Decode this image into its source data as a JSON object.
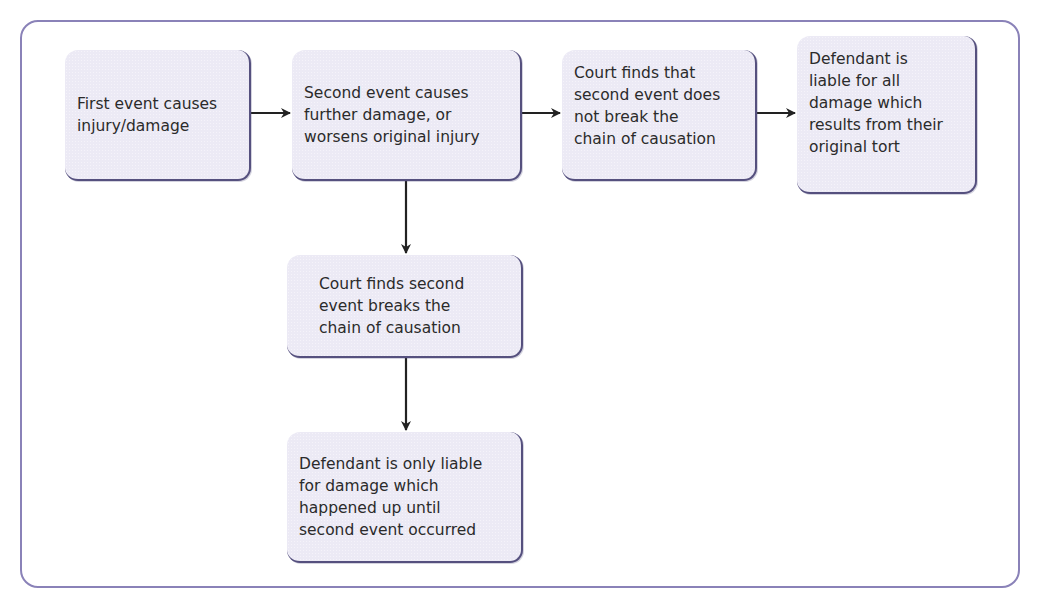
{
  "diagram": {
    "type": "flowchart",
    "nodes": [
      {
        "id": "first_event",
        "text": "First event causes\ninjury/damage"
      },
      {
        "id": "second_event",
        "text": "Second event causes\nfurther damage, or\nworsens original injury"
      },
      {
        "id": "court_not_break",
        "text": "Court finds that\nsecond event does\nnot break the\nchain of causation"
      },
      {
        "id": "liable_all",
        "text": "Defendant is\nliable for all\ndamage which\nresults from their\noriginal tort"
      },
      {
        "id": "court_breaks",
        "text": "Court finds second\nevent breaks the\nchain of causation"
      },
      {
        "id": "liable_only",
        "text": "Defendant is only liable\nfor damage which\nhappened up until\nsecond event occurred"
      }
    ],
    "edges": [
      {
        "from": "first_event",
        "to": "second_event"
      },
      {
        "from": "second_event",
        "to": "court_not_break"
      },
      {
        "from": "court_not_break",
        "to": "liable_all"
      },
      {
        "from": "second_event",
        "to": "court_breaks"
      },
      {
        "from": "court_breaks",
        "to": "liable_only"
      }
    ],
    "colors": {
      "frame_border": "#8a82b8",
      "node_fill": "#eceaf5",
      "node_shadow": "#55507e",
      "arrow": "#222222",
      "text": "#2b2b2b"
    }
  }
}
